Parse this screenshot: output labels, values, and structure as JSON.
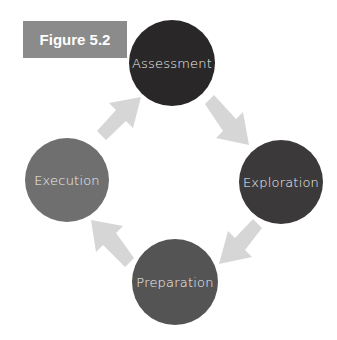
{
  "figure_label": "Figure 5.2",
  "nodes": [
    {
      "label": "Assessment",
      "color": "#2a2729",
      "cx": 172,
      "cy": 63,
      "r": 43
    },
    {
      "label": "Exploration",
      "color": "#3c393b",
      "cx": 281,
      "cy": 182,
      "r": 42
    },
    {
      "label": "Preparation",
      "color": "#555455",
      "cx": 175,
      "cy": 282,
      "r": 43
    },
    {
      "label": "Execution",
      "color": "#6f6f6f",
      "cx": 67,
      "cy": 180,
      "r": 42
    }
  ],
  "arrow_color": "#d6d6d6",
  "flow": [
    "Assessment",
    "Exploration",
    "Preparation",
    "Execution",
    "Assessment"
  ]
}
